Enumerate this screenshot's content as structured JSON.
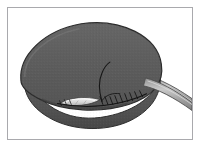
{
  "figure": {
    "domain": "medical-surgical-illustration",
    "title": "Sutured organ with exiting tube",
    "frame": {
      "border_color": "#a9a9ad",
      "background_color": "#ffffff",
      "outer_margin_color": "#ffffff"
    },
    "palette": {
      "background": "#ffffff",
      "organ_upper_fill": "#5e5e5e",
      "organ_lower_fill": "#565656",
      "organ_shadow": "#4a4a4a",
      "organ_highlight": "#6d6d6d",
      "outline": "#2c2c2c",
      "incision_light": "#e6e6e6",
      "incision_mid": "#bdbdbd",
      "suture_thread": "#1a1a1a",
      "tube_fill": "#9a9a9a",
      "tube_highlight": "#c8c8c8",
      "tube_outline": "#4f4f4f"
    },
    "elements": [
      {
        "id": "organ-upper-lobe",
        "name": "organ-upper-lobe",
        "label": "Upper rounded lobe of organ",
        "fill": "#5e5e5e"
      },
      {
        "id": "organ-lower-lobe",
        "name": "organ-lower-lobe",
        "label": "Lower rounded lobe of organ",
        "fill": "#565656"
      },
      {
        "id": "incision-opening",
        "name": "incision-opening",
        "label": "Open incision showing pale interior",
        "fill": "#e6e6e6"
      },
      {
        "id": "suture-line",
        "name": "suture-line",
        "label": "Running suture closing the incision",
        "stitch_count": 9,
        "stroke": "#1a1a1a"
      },
      {
        "id": "suture-tail",
        "name": "suture-tail",
        "label": "Curved suture thread tail",
        "stroke": "#1a1a1a"
      },
      {
        "id": "drain-tube",
        "name": "drain-tube",
        "label": "Tube exiting organ toward lower right",
        "fill": "#9a9a9a"
      }
    ]
  }
}
